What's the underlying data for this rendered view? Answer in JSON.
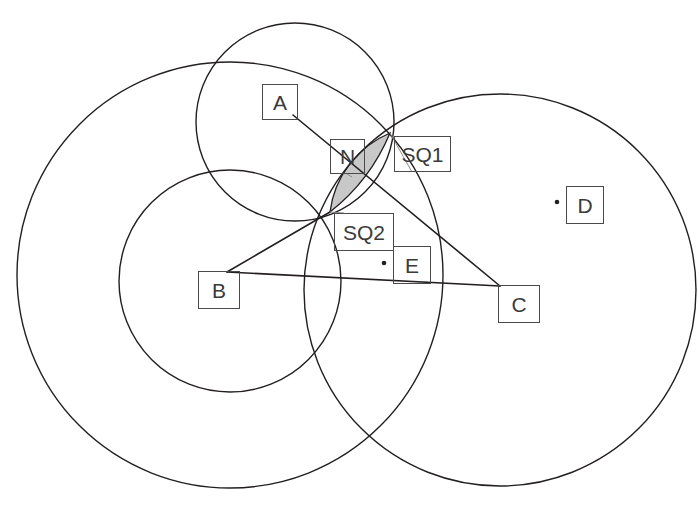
{
  "diagram": {
    "background_color": "#ffffff",
    "stroke_color": "#231f20",
    "shade_color": "#c8c8c8",
    "leader_color": "#8c8c8c",
    "label_border_color": "#4a4a4a"
  },
  "labels": [
    {
      "id": "A",
      "text": "A",
      "box": {
        "x": 262,
        "y": 84,
        "w": 36,
        "h": 36
      }
    },
    {
      "id": "N",
      "text": "N",
      "box": {
        "x": 330,
        "y": 139,
        "w": 35,
        "h": 35
      }
    },
    {
      "id": "SQ1",
      "text": "SQ1",
      "box": {
        "x": 394,
        "y": 136,
        "w": 57,
        "h": 36
      }
    },
    {
      "id": "SQ2",
      "text": "SQ2",
      "box": {
        "x": 334,
        "y": 213,
        "w": 60,
        "h": 38
      }
    },
    {
      "id": "E",
      "text": "E",
      "box": {
        "x": 393,
        "y": 246,
        "w": 38,
        "h": 38
      }
    },
    {
      "id": "D",
      "text": "D",
      "box": {
        "x": 566,
        "y": 186,
        "w": 38,
        "h": 38
      }
    },
    {
      "id": "B",
      "text": "B",
      "box": {
        "x": 198,
        "y": 271,
        "w": 42,
        "h": 38
      }
    },
    {
      "id": "C",
      "text": "C",
      "box": {
        "x": 498,
        "y": 285,
        "w": 42,
        "h": 38
      }
    }
  ],
  "geometry": {
    "circles": [
      {
        "name": "big-left-circle",
        "cx": 230,
        "cy": 275,
        "r": 213
      },
      {
        "name": "right-circle",
        "cx": 500,
        "cy": 290,
        "r": 196
      },
      {
        "name": "medium-circle",
        "cx": 230,
        "cy": 281,
        "r": 111
      },
      {
        "name": "upper-small-circle",
        "cx": 295,
        "cy": 122,
        "r": 99
      }
    ],
    "points": [
      {
        "name": "A",
        "x": 293,
        "y": 115,
        "visible_dot": false
      },
      {
        "name": "B",
        "x": 227,
        "y": 272,
        "visible_dot": false
      },
      {
        "name": "C",
        "x": 500,
        "y": 286,
        "visible_dot": false
      },
      {
        "name": "D",
        "x": 557,
        "y": 202,
        "visible_dot": true
      },
      {
        "name": "E",
        "x": 384,
        "y": 263,
        "visible_dot": true
      },
      {
        "name": "SQ1",
        "x": 390,
        "y": 133,
        "visible_dot": false
      },
      {
        "name": "SQ2",
        "x": 330,
        "y": 212,
        "visible_dot": false
      }
    ],
    "segments": [
      {
        "name": "segment-A-C",
        "x1": 293,
        "y1": 115,
        "x2": 500,
        "y2": 286
      },
      {
        "name": "segment-B-C",
        "x1": 227,
        "y1": 272,
        "x2": 500,
        "y2": 286
      },
      {
        "name": "segment-B-SQ2-up",
        "x1": 227,
        "y1": 272,
        "x2": 330,
        "y2": 212
      }
    ],
    "shaded_lens": {
      "name": "lens-SQ1-SQ2",
      "from": "SQ1",
      "to": "SQ2",
      "fill": "#c8c8c8"
    }
  }
}
